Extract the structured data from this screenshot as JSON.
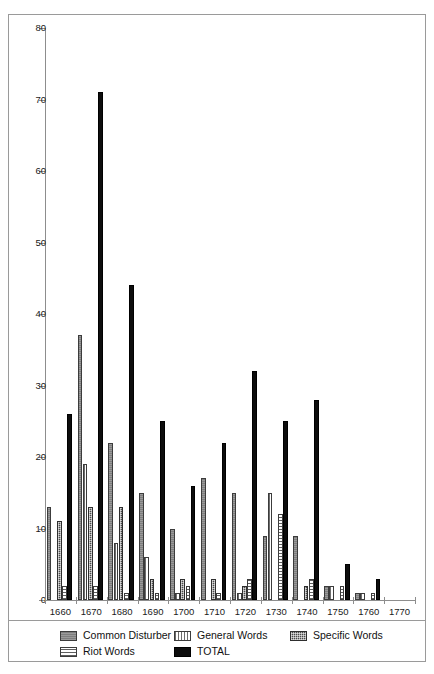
{
  "chart_data": {
    "type": "bar",
    "title": "",
    "subtitle": "",
    "xlabel": "",
    "ylabel": "",
    "ylim": [
      0,
      80
    ],
    "yticks": [
      0,
      10,
      20,
      30,
      40,
      50,
      60,
      70,
      80
    ],
    "ytick_labels": [
      "0",
      "10",
      "20",
      "30",
      "40",
      "50",
      "60",
      "70",
      "80"
    ],
    "xlim_labels": [
      "1660",
      "1670",
      "1680",
      "1690",
      "1700",
      "1710",
      "1720",
      "1730",
      "1740",
      "1750",
      "1760",
      "1770"
    ],
    "categories": [
      "1660",
      "1670",
      "1680",
      "1690",
      "1700",
      "1710",
      "1720",
      "1730",
      "1740",
      "1750",
      "1760",
      "1770"
    ],
    "grid": false,
    "legend_position": "bottom",
    "series": [
      {
        "name": "Common Disturber",
        "pattern": "solid-gray",
        "color": "#7e7e7e",
        "values": [
          13,
          37,
          22,
          15,
          10,
          17,
          15,
          9,
          9,
          2,
          1,
          0
        ]
      },
      {
        "name": "General Words",
        "pattern": "vertical-lines",
        "color": "#6d6d6d",
        "values": [
          0,
          19,
          8,
          6,
          1,
          0,
          1,
          15,
          0,
          2,
          1,
          0
        ]
      },
      {
        "name": "Specific Words",
        "pattern": "checkered",
        "color": "#4a4a4a",
        "values": [
          11,
          13,
          13,
          3,
          3,
          3,
          2,
          0,
          2,
          0,
          0,
          0
        ]
      },
      {
        "name": "Riot Words",
        "pattern": "horizontal-lines",
        "color": "#5f5f5f",
        "values": [
          2,
          2,
          1,
          1,
          2,
          1,
          3,
          12,
          3,
          2,
          1,
          0
        ]
      },
      {
        "name": "TOTAL",
        "pattern": "solid-black",
        "color": "#0d0d0d",
        "values": [
          26,
          71,
          44,
          25,
          16,
          22,
          32,
          25,
          28,
          5,
          3,
          0
        ]
      }
    ]
  },
  "legend": {
    "items": [
      {
        "label": "Common Disturber",
        "pattern": "solid-gray"
      },
      {
        "label": "General Words",
        "pattern": "vertical-lines"
      },
      {
        "label": "Specific Words",
        "pattern": "checkered"
      },
      {
        "label": "Riot Words",
        "pattern": "horizontal-lines"
      },
      {
        "label": "TOTAL",
        "pattern": "solid-black"
      }
    ]
  }
}
